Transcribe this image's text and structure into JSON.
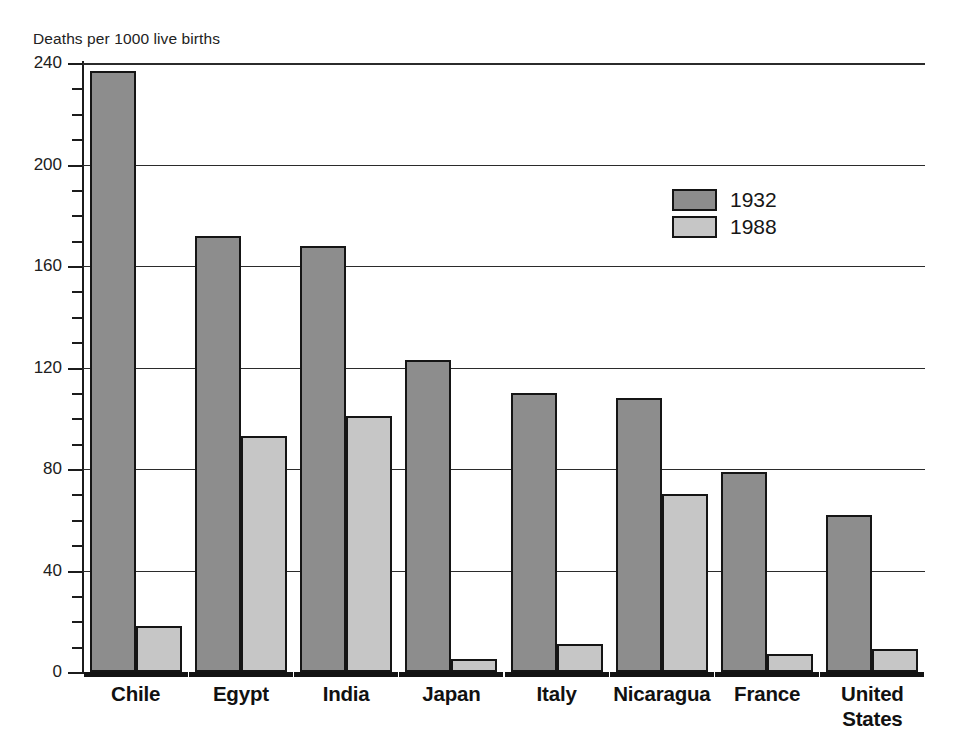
{
  "chart_data": {
    "type": "bar",
    "title": "Deaths per 1000 live births",
    "xlabel": "",
    "ylabel": "Deaths per 1000 live births",
    "ylim": [
      0,
      240
    ],
    "yticks": [
      0,
      40,
      80,
      120,
      160,
      200,
      240
    ],
    "ytick_labels": [
      "0",
      "40",
      "80",
      "120",
      "160",
      "200",
      "240"
    ],
    "minor_tick_step": 10,
    "grid": true,
    "legend_position": "upper-right-inside",
    "categories": [
      "Chile",
      "Egypt",
      "India",
      "Japan",
      "Italy",
      "Nicaragua",
      "France",
      "United States"
    ],
    "category_labels": [
      [
        "Chile"
      ],
      [
        "Egypt"
      ],
      [
        "India"
      ],
      [
        "Japan"
      ],
      [
        "Italy"
      ],
      [
        "Nicaragua"
      ],
      [
        "France"
      ],
      [
        "United",
        "States"
      ]
    ],
    "series": [
      {
        "name": "1932",
        "color": "#8d8d8d",
        "values": [
          237,
          172,
          168,
          123,
          110,
          108,
          79,
          62
        ]
      },
      {
        "name": "1988",
        "color": "#c6c6c6",
        "values": [
          18,
          93,
          101,
          5,
          11,
          70,
          7,
          9
        ]
      }
    ]
  },
  "legend": {
    "entries": [
      {
        "label": "1932",
        "swatch": "s1932"
      },
      {
        "label": "1988",
        "swatch": "s1988"
      }
    ]
  },
  "colors": {
    "series_1932": "#8d8d8d",
    "series_1988": "#c6c6c6",
    "outline": "#151515",
    "gridline": "#2b2b2b",
    "background": "#ffffff"
  }
}
